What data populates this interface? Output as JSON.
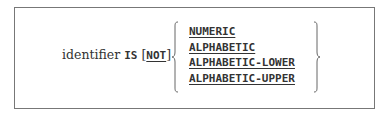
{
  "syntax": {
    "identifier": "identifier",
    "is_keyword": "IS",
    "not_open": "[",
    "not_keyword": "NOT",
    "not_close": "]",
    "options": [
      "NUMERIC",
      "ALPHABETIC",
      "ALPHABETIC-LOWER",
      "ALPHABETIC-UPPER"
    ]
  }
}
